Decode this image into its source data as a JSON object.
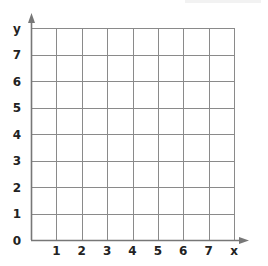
{
  "chart_data": {
    "type": "grid",
    "title": "",
    "xlabel": "x",
    "ylabel": "y",
    "origin_label": "0",
    "x_ticks": [
      "1",
      "2",
      "3",
      "4",
      "5",
      "6",
      "7"
    ],
    "y_ticks": [
      "1",
      "2",
      "3",
      "4",
      "5",
      "6",
      "7"
    ],
    "xlim": [
      0,
      8
    ],
    "ylim": [
      0,
      8
    ],
    "grid": true,
    "series": []
  },
  "colors": {
    "grid": "#8a8a8a",
    "axis": "#777777",
    "label": "#222222"
  }
}
